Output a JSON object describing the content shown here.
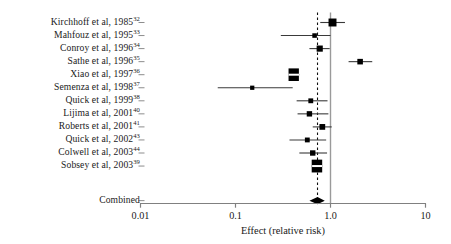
{
  "figure": {
    "type": "forest-plot",
    "axis_title": "Effect (relative risk)"
  },
  "axis": {
    "scale": "log10",
    "min": 0.01,
    "max": 10,
    "ticks": [
      {
        "value": 0.01,
        "label": "0.01"
      },
      {
        "value": 0.1,
        "label": "0.1"
      },
      {
        "value": 1.0,
        "label": "1.0"
      },
      {
        "value": 10,
        "label": "10"
      }
    ],
    "reference_line": 1.0,
    "pooled_line": 0.73
  },
  "colors": {
    "marker": "#000000",
    "line": "#3a3a3a",
    "axis": "#808080",
    "text": "#1a1a1a"
  },
  "chart_data": {
    "type": "forest",
    "title": "",
    "xlabel": "Effect (relative risk)",
    "ylabel": "",
    "xlim": [
      0.01,
      10
    ],
    "xscale": "log",
    "grid": false,
    "legend": "none",
    "reference_line": 1.0,
    "pooled_line": 0.73,
    "studies": [
      {
        "label": "Kirchhoff et al, 1985",
        "ref": "32",
        "rr": 1.05,
        "lo": 0.78,
        "hi": 1.42,
        "weight": 0.92
      },
      {
        "label": "Mahfouz et al, 1995",
        "ref": "33",
        "rr": 0.68,
        "lo": 0.3,
        "hi": 1.0,
        "weight": 0.3
      },
      {
        "label": "Conroy et al, 1996",
        "ref": "34",
        "rr": 0.77,
        "lo": 0.6,
        "hi": 0.98,
        "weight": 0.55
      },
      {
        "label": "Sathe et al, 1996",
        "ref": "35",
        "rr": 2.05,
        "lo": 1.55,
        "hi": 2.75,
        "weight": 0.45
      },
      {
        "label": "Xiao et al, 1997",
        "ref": "36",
        "rr": 0.41,
        "lo": 0.36,
        "hi": 0.47,
        "weight": 1.55
      },
      {
        "label": "Semenza et al, 1998",
        "ref": "37",
        "rr": 0.15,
        "lo": 0.065,
        "hi": 0.4,
        "weight": 0.26
      },
      {
        "label": "Quick et al, 1999",
        "ref": "38",
        "rr": 0.62,
        "lo": 0.44,
        "hi": 0.93,
        "weight": 0.34
      },
      {
        "label": "Lijima et al, 2001",
        "ref": "40",
        "rr": 0.6,
        "lo": 0.45,
        "hi": 0.95,
        "weight": 0.42
      },
      {
        "label": "Roberts et al, 2001",
        "ref": "41",
        "rr": 0.82,
        "lo": 0.65,
        "hi": 1.03,
        "weight": 0.48
      },
      {
        "label": "Quick et al, 2002",
        "ref": "43",
        "rr": 0.57,
        "lo": 0.37,
        "hi": 0.9,
        "weight": 0.34
      },
      {
        "label": "Colwell et al, 2003",
        "ref": "44",
        "rr": 0.65,
        "lo": 0.47,
        "hi": 0.92,
        "weight": 0.42
      },
      {
        "label": "Sobsey et al, 2003",
        "ref": "39",
        "rr": 0.72,
        "lo": 0.64,
        "hi": 0.82,
        "weight": 1.6
      }
    ],
    "combined": {
      "label": "Combined",
      "rr": 0.73,
      "lo": 0.6,
      "hi": 0.87
    }
  }
}
